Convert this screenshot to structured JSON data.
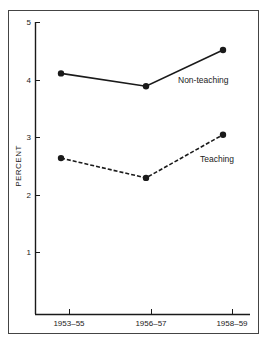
{
  "chart_data": {
    "type": "line",
    "title": "",
    "xlabel": "",
    "ylabel": "PERCENT",
    "categories": [
      "1953–55",
      "1956–57",
      "1958–59"
    ],
    "series": [
      {
        "name": "Non-teaching",
        "values": [
          4.12,
          3.9,
          4.52
        ],
        "line_style": "solid",
        "color": "#1a1a1a"
      },
      {
        "name": "Teaching",
        "values": [
          2.67,
          2.33,
          3.07
        ],
        "line_style": "dashed",
        "color": "#1a1a1a"
      }
    ],
    "yticks": [
      "1",
      "2",
      "3",
      "4",
      "5"
    ],
    "ylim": [
      0,
      5
    ],
    "grid": false,
    "legend_position": "inline labels near series"
  }
}
